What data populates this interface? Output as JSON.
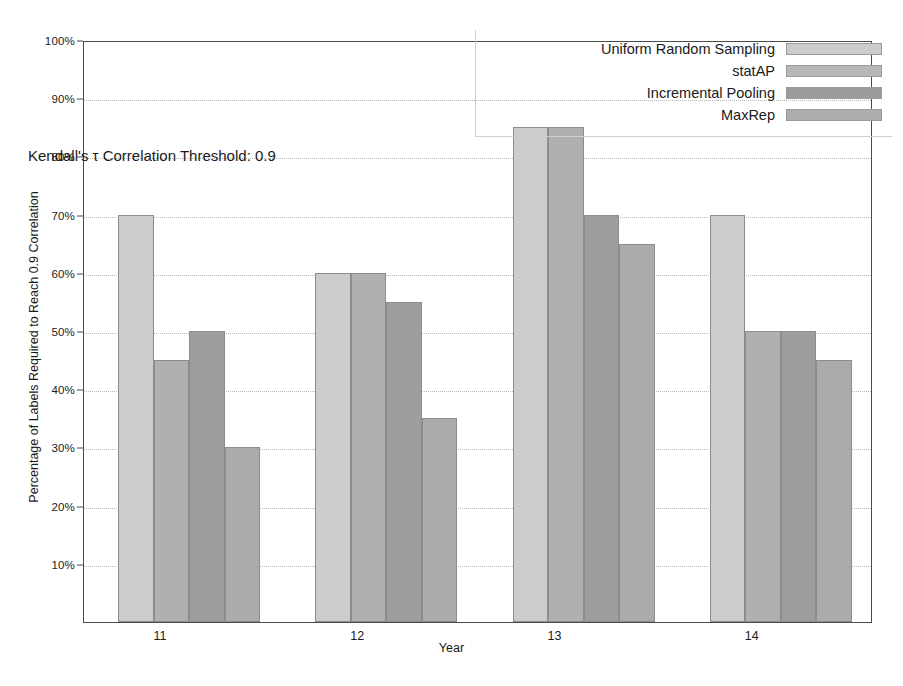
{
  "chart_data": {
    "type": "bar",
    "title": "",
    "annotation": "Kendall's τ Correlation Threshold: 0.9",
    "xlabel": "Year",
    "ylabel": "Percentage of Labels Required to Reach 0.9 Correlation",
    "categories": [
      "11",
      "12",
      "13",
      "14"
    ],
    "ylim": [
      0,
      100
    ],
    "ytick_labels": [
      "10%",
      "20%",
      "30%",
      "40%",
      "50%",
      "60%",
      "70%",
      "80%",
      "90%",
      "100%"
    ],
    "ytick_values": [
      10,
      20,
      30,
      40,
      50,
      60,
      70,
      80,
      90,
      100
    ],
    "grid": true,
    "legend_position": "top-right",
    "series": [
      {
        "name": "Uniform Random Sampling",
        "color": "#cccccc",
        "values": [
          70,
          60,
          85,
          70
        ]
      },
      {
        "name": "statAP",
        "color": "#b0b0b0",
        "values": [
          45,
          60,
          85,
          50
        ]
      },
      {
        "name": "Incremental Pooling",
        "color": "#9e9e9e",
        "values": [
          50,
          55,
          70,
          50
        ]
      },
      {
        "name": "MaxRep",
        "color": "#ababab",
        "values": [
          30,
          35,
          65,
          45
        ]
      }
    ]
  },
  "legend": {
    "items": [
      {
        "label": "Uniform Random Sampling",
        "color": "#cccccc"
      },
      {
        "label": "statAP",
        "color": "#b7b7b7"
      },
      {
        "label": "Incremental Pooling",
        "color": "#9c9c9c"
      },
      {
        "label": "MaxRep",
        "color": "#adadad"
      }
    ]
  },
  "axes": {
    "y_title": "Percentage of Labels Required to Reach 0.9 Correlation",
    "x_title": "Year"
  }
}
